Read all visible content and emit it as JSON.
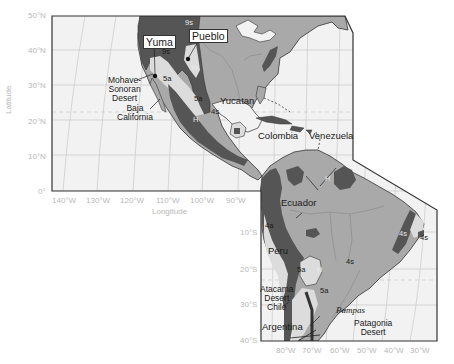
{
  "figure": {
    "type": "climate-zone map",
    "region": "The Americas"
  },
  "axes": {
    "y_title": "Latitude",
    "x_title": "Longitude",
    "lat_ticks_upper": [
      "50°N",
      "40°N",
      "30°N",
      "20°N",
      "10°N",
      "0°"
    ],
    "lat_ticks_lower": [
      "10°S",
      "20°S",
      "30°S",
      "40°S"
    ],
    "lon_ticks_upper": [
      "140°W",
      "130°W",
      "120°W",
      "110°W",
      "100°W",
      "90°W"
    ],
    "lon_ticks_lower": [
      "80°W",
      "70°W",
      "60°W",
      "50°W",
      "40°W",
      "30°W"
    ]
  },
  "place_labels": {
    "yuma": "Yuma",
    "pueblo": "Pueblo",
    "mohave_1": "Mohave-",
    "mohave_2": "Sonoran",
    "mohave_3": "Desert",
    "baja_1": "Baja",
    "baja_2": "California",
    "yucatan": "Yucatan",
    "colombia": "Colombia",
    "venezuela": "Venezuela",
    "ecuador": "Ecuador",
    "peru": "Peru",
    "atacama_1": "Atacama",
    "atacama_2": "Desert",
    "atacama_3": "Chile",
    "argentina": "Argentina",
    "pampas": "Pampas",
    "patagonia_1": "Patagonia",
    "patagonia_2": "Desert"
  },
  "zone_labels": {
    "z9s_a": "9s",
    "z9s_b": "9s",
    "z9s_c": "9s",
    "z5a_a": "5a",
    "z5a_b": "5a",
    "z4s_a": "4s",
    "h_mex": "H",
    "h_ven": "H",
    "z4a": "4a",
    "z5a_c": "5a",
    "h_and": "H",
    "z4s_b": "4s",
    "z5a_d": "5a",
    "z4s_c": "4s",
    "z4s_d": "4s"
  },
  "colors": {
    "ocean": "#f2f2f2",
    "land_light": "#a9a9a9",
    "land_dark": "#555555",
    "dry_zone": "#dcdcdc",
    "grid": "#c8c8c8",
    "frame": "#333333",
    "tick_text": "#b8b8b8"
  }
}
